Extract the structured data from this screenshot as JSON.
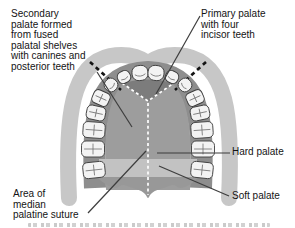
{
  "figure": {
    "labels": {
      "secondary_palate": "Secondary\npalate formed\nfrom fused\npalatal shelves\nwith canines and\nposterior teeth",
      "primary_palate": "Primary palate\nwith four\nincisor teeth",
      "median_suture_area": "Area of\nmedian\npalatine suture",
      "hard_palate": "Hard palate",
      "soft_palate": "Soft palate"
    },
    "colors": {
      "outer-arch": "#c7c7c7",
      "gum-ridge": "#8e8e8e",
      "hard-palate": "#9d9d9d",
      "primary-palate-triangle": "#7c7c7c",
      "junction-band": "#c2c2c2",
      "soft-palate": "#989898",
      "tooth": "#f3f3f3",
      "tooth-outline": "#3c3c3c",
      "leader-line": "#3d3d3d",
      "fusion-dash": "#141414",
      "suture-dash": "#ffffff",
      "text": "#141414"
    }
  }
}
